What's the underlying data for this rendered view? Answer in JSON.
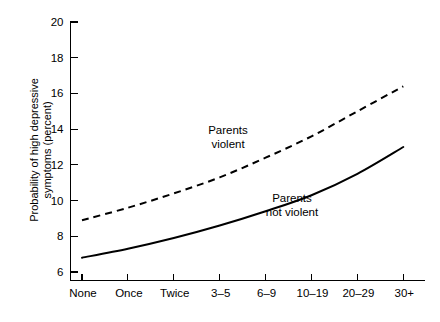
{
  "chart_data": {
    "type": "line",
    "title": "",
    "xlabel": "",
    "ylabel": "Probability of high depressive symptoms (percent)",
    "ylabel_line1": "Probability of high depressive",
    "ylabel_line2": "symptoms (percent)",
    "categories": [
      "None",
      "Once",
      "Twice",
      "3–5",
      "6–9",
      "10–19",
      "20–29",
      "30+"
    ],
    "ylim": [
      6,
      20
    ],
    "yticks": [
      6,
      8,
      10,
      12,
      14,
      16,
      18,
      20
    ],
    "ytick_labels": [
      "6",
      "8",
      "10",
      "12",
      "14",
      "16",
      "18",
      "20"
    ],
    "grid": false,
    "legend_position": "inline-annotation",
    "series": [
      {
        "name": "Parents violent",
        "style": "dashed",
        "color": "#000000",
        "values": [
          8.9,
          9.6,
          10.4,
          11.3,
          12.4,
          13.6,
          15.0,
          16.4
        ]
      },
      {
        "name": "Parents not violent",
        "style": "solid",
        "color": "#000000",
        "values": [
          6.8,
          7.3,
          7.9,
          8.6,
          9.4,
          10.3,
          11.5,
          13.0
        ]
      }
    ],
    "annotations": [
      {
        "id": "annot-parents-violent",
        "line1": "Parents",
        "line2": "violent",
        "x": 228,
        "y": 134
      },
      {
        "id": "annot-parents-not-violent",
        "line1": "Parents",
        "line2": "not violent",
        "x": 292,
        "y": 202
      }
    ]
  }
}
